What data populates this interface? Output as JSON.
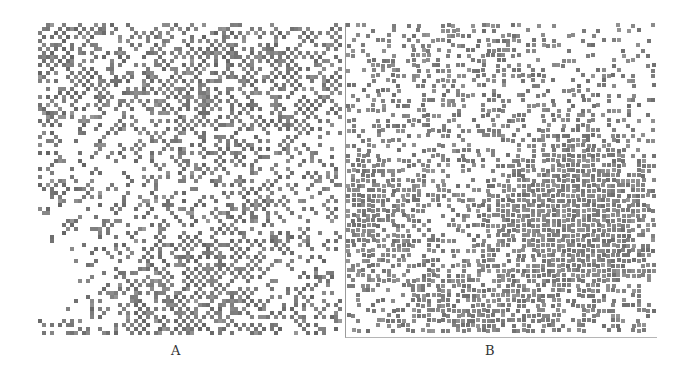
{
  "figure": {
    "panels": [
      {
        "id": "A",
        "label": "A",
        "description": "lattice pattern of gray square cells forming connected chains",
        "cell_size": 4,
        "density": 0.3,
        "color": "#7a7a7a",
        "style": "lattice"
      },
      {
        "id": "B",
        "label": "B",
        "description": "scattered gray dots with clustered regions",
        "cell_size": 4,
        "density": 0.22,
        "color": "#808080",
        "style": "clustered"
      }
    ],
    "background": "#ffffff",
    "border_color": "#9a9a9a"
  }
}
